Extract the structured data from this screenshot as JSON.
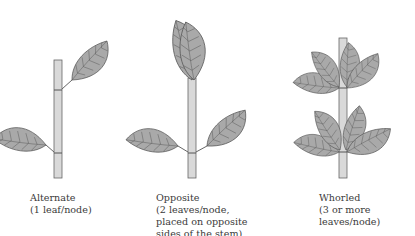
{
  "figure": {
    "colors": {
      "leaf": "#a9a9a9",
      "stem": "#d9d9d9",
      "outline": "#555555",
      "text": "#3a3a3a"
    },
    "panels": [
      {
        "name": "Alternate",
        "label": "Alternate",
        "line1": "(1 leaf/node)",
        "line2": "",
        "line3": ""
      },
      {
        "name": "Opposite",
        "label": "Opposite",
        "line1": "(2 leaves/node,",
        "line2": "placed on opposite",
        "line3": "sides of the stem)"
      },
      {
        "name": "Whorled",
        "label": "Whorled",
        "line1": "(3 or more",
        "line2": "leaves/node)",
        "line3": ""
      }
    ]
  }
}
